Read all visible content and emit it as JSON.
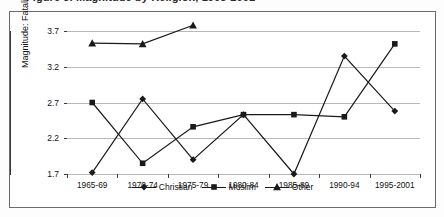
{
  "title": "Figure 3. Magnitude by Religion, 1965-2001",
  "frame": {
    "border_color": "#6a6a6a"
  },
  "chart_data": {
    "type": "line",
    "title": "Figure 3. Magnitude by Religion, 1965-2001",
    "xlabel": "",
    "ylabel": "Magnitude: Fatalities Scale",
    "categories": [
      "1965-69",
      "1970-74",
      "1975-79",
      "1980-84",
      "1985-89",
      "1990-94",
      "1995-2001"
    ],
    "yticks": [
      1.7,
      2.2,
      2.7,
      3.2,
      3.7
    ],
    "ylim": [
      1.7,
      3.7
    ],
    "grid": true,
    "legend_position": "bottom",
    "series": [
      {
        "name": "Christian",
        "marker": "diamond",
        "color": "#1a1a1a",
        "values": [
          1.72,
          2.75,
          1.9,
          2.53,
          1.7,
          3.35,
          2.58
        ]
      },
      {
        "name": "Muslim",
        "marker": "square",
        "color": "#1a1a1a",
        "values": [
          2.7,
          1.85,
          2.36,
          2.53,
          2.53,
          2.5,
          3.52
        ]
      },
      {
        "name": "Other",
        "marker": "triangle",
        "color": "#1a1a1a",
        "values": [
          3.53,
          3.52,
          3.78,
          null,
          null,
          null,
          null
        ]
      }
    ]
  },
  "legend": {
    "items": [
      {
        "label": "Christian",
        "marker": "diamond"
      },
      {
        "label": "Muslim",
        "marker": "square"
      },
      {
        "label": "Other",
        "marker": "triangle"
      }
    ]
  }
}
